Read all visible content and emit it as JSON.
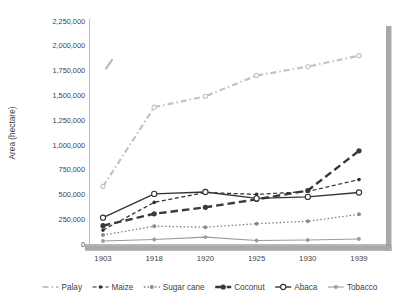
{
  "chart_data": {
    "type": "line",
    "title": "",
    "xlabel": "",
    "ylabel": "Area (hectare)",
    "categories": [
      "1903",
      "1918",
      "1920",
      "1925",
      "1930",
      "1939"
    ],
    "ylim": [
      0,
      2250000
    ],
    "ytick_step": 250000,
    "ytick_labels": [
      "0",
      "250,000",
      "500,000",
      "750,000",
      "1,000,000",
      "1,250,000",
      "1,500,000",
      "1,750,000",
      "2,000,000",
      "2,250,000"
    ],
    "grid": false,
    "legend_position": "bottom",
    "axis_color": "#c0c0c0",
    "x_axis_color": "#8f8f8f",
    "shadow_color": "#a9a9a9",
    "text_color": "#3f3f3f",
    "series": [
      {
        "name": "Palay",
        "values": [
          580000,
          1380000,
          1490000,
          1700000,
          1790000,
          1900000
        ],
        "color": "#c3c3c3",
        "dash": "dashdot",
        "line_width": 2.2,
        "marker": "open-circle",
        "marker_size": 2.1,
        "legend_marker": false
      },
      {
        "name": "Maize",
        "values": [
          140000,
          420000,
          520000,
          500000,
          530000,
          650000
        ],
        "color": "#2f2f2f",
        "dash": "dashed",
        "line_width": 1.2,
        "marker": "filled-circle",
        "marker_size": 1.8,
        "legend_marker": true
      },
      {
        "name": "Sugar cane",
        "values": [
          90000,
          180000,
          170000,
          205000,
          230000,
          300000
        ],
        "color": "#7f7f7f",
        "dash": "dotted",
        "line_width": 1.3,
        "marker": "filled-circle",
        "marker_size": 2.0,
        "marker_color": "#8c8c8c",
        "legend_marker": true
      },
      {
        "name": "Coconut",
        "values": [
          185000,
          305000,
          370000,
          450000,
          540000,
          940000
        ],
        "color": "#3a3a3a",
        "dash": "heavydash",
        "line_width": 2.4,
        "marker": "filled-circle",
        "marker_size": 2.6,
        "legend_marker": true
      },
      {
        "name": "Abaca",
        "values": [
          265000,
          505000,
          525000,
          460000,
          475000,
          520000
        ],
        "color": "#333333",
        "dash": "solid",
        "line_width": 1.4,
        "marker": "open-circle",
        "marker_size": 2.6,
        "legend_marker": true
      },
      {
        "name": "Tobacco",
        "values": [
          30000,
          45000,
          70000,
          35000,
          40000,
          50000
        ],
        "color": "#9b9b9b",
        "dash": "solid",
        "line_width": 1.1,
        "marker": "filled-circle",
        "marker_size": 1.9,
        "legend_marker": true
      }
    ]
  }
}
